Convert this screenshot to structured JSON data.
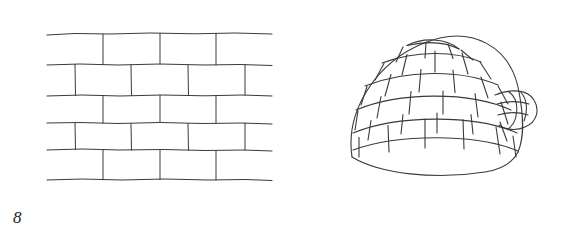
{
  "page": {
    "background_color": "#ffffff",
    "ink_color": "#2b2b2b",
    "width": 569,
    "height": 235,
    "style": "hand-drawn pencil line illustration worksheet"
  },
  "figures": [
    {
      "number": "8",
      "subject": "brick-wall",
      "title": "Brick wall",
      "description": "Hand drawn brick wall in running bond pattern with five courses of rectangular bricks, each course offset by half a brick.",
      "rows": 5,
      "bond_pattern": "running bond",
      "bricks_per_row": [
        4,
        4,
        4,
        4,
        4
      ],
      "line_color": "#3a3a3a",
      "fill_color": "#ffffff"
    },
    {
      "number": "9",
      "subject": "igloo",
      "title": "Igloo",
      "description": "Hand drawn igloo dome built from curved rows of snow blocks with a small arched entrance tunnel on the right side.",
      "dome_rows": 6,
      "has_keystone_cap": true,
      "entrance_side": "right",
      "entrance_blocks": 3,
      "line_color": "#3a3a3a",
      "fill_color": "#ffffff"
    }
  ],
  "artifacts": {
    "smudge": {
      "name": "faint pencil smudge",
      "color": "#b9b9b9"
    }
  }
}
